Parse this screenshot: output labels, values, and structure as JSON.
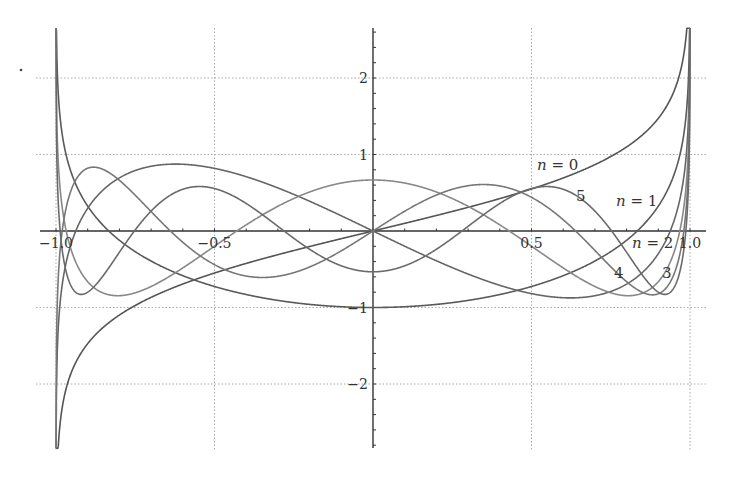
{
  "chart_data": {
    "type": "line",
    "title": "",
    "xlabel": "",
    "ylabel": "",
    "xlim": [
      -1.05,
      1.05
    ],
    "ylim": [
      -2.84,
      2.65
    ],
    "grid": true,
    "x_ticks": [
      -1.0,
      -0.5,
      0.5,
      1.0
    ],
    "x_tick_labels": [
      "−1.0",
      "−0.5",
      "0.5",
      "1.0"
    ],
    "y_ticks": [
      2,
      1,
      -1,
      -2
    ],
    "y_tick_labels": [
      "2",
      "1",
      "−1",
      "−2"
    ],
    "series": [
      {
        "name": "n = 0",
        "n": 0,
        "label": "n = 0",
        "color": "#555555",
        "x": [
          -0.9,
          -0.5,
          0,
          0.5,
          0.9
        ],
        "values": [
          -1.47,
          -0.55,
          0,
          0.55,
          1.47
        ]
      },
      {
        "name": "n = 1",
        "n": 1,
        "label": "n = 1",
        "color": "#5a5a5a",
        "x": [
          -0.9,
          -0.5,
          0,
          0.5,
          0.9
        ],
        "values": [
          0.32,
          -0.73,
          -1.0,
          -0.73,
          0.32
        ]
      },
      {
        "name": "n = 2",
        "n": 2,
        "label": "n = 2",
        "color": "#666666",
        "x": [
          -0.9,
          -0.5,
          0,
          0.5,
          0.9
        ],
        "values": [
          -0.81,
          0.82,
          0,
          -0.82,
          0.81
        ]
      },
      {
        "name": "n = 3",
        "n": 3,
        "label": "3",
        "color": "#888888",
        "x": [
          -0.9,
          -0.5,
          0,
          0.5,
          0.9
        ],
        "values": [
          0.41,
          0.24,
          0.667,
          0.24,
          0.41
        ]
      },
      {
        "name": "n = 4",
        "n": 4,
        "label": "4",
        "color": "#777777",
        "x": [
          -0.9,
          -0.5,
          0,
          0.5,
          0.9
        ],
        "values": [
          0.28,
          -0.64,
          0,
          0.64,
          -0.28
        ]
      },
      {
        "name": "n = 5",
        "n": 5,
        "label": "5",
        "color": "#6a6a6a",
        "x": [
          -0.9,
          -0.5,
          0,
          0.5,
          0.9
        ],
        "values": [
          -0.65,
          0.53,
          -0.533,
          0.53,
          -0.65
        ]
      }
    ],
    "annotations": [
      {
        "text_italic": "n",
        "text_rest": " = 0",
        "x_px": 537,
        "y_px": 170
      },
      {
        "text_italic": "",
        "text_rest": "5",
        "x_px": 576,
        "y_px": 201
      },
      {
        "text_italic": "n",
        "text_rest": " = 1",
        "x_px": 616,
        "y_px": 206
      },
      {
        "text_italic": "n",
        "text_rest": " = 2",
        "x_px": 632,
        "y_px": 248
      },
      {
        "text_italic": "",
        "text_rest": "4",
        "x_px": 614,
        "y_px": 278
      },
      {
        "text_italic": "",
        "text_rest": "3",
        "x_px": 662,
        "y_px": 278
      }
    ]
  }
}
